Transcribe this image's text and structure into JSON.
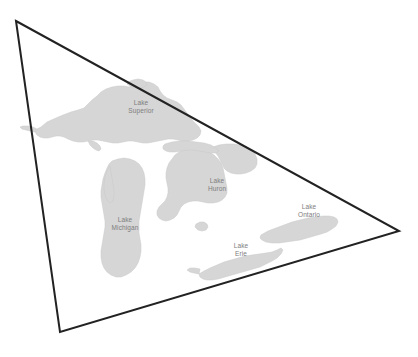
{
  "figure": {
    "name": "great-lakes-triangle-overlay",
    "background_color": "#ffffff",
    "width": 418,
    "height": 357
  },
  "overlay": {
    "shape": "triangle",
    "stroke_color": "#222222",
    "stroke_width": 2,
    "fill": "none",
    "vertices": [
      {
        "name": "top-left-vertex",
        "x": 16,
        "y": 21
      },
      {
        "name": "right-vertex",
        "x": 399,
        "y": 231
      },
      {
        "name": "bottom-left-vertex",
        "x": 60,
        "y": 332
      }
    ],
    "points_attr": "16,21 399,231 60,332"
  },
  "lakes": {
    "fill_color": "#d6d6d6",
    "label_color": "#7d7d7d",
    "items": [
      {
        "id": "lake-superior",
        "label": "Lake\nSuperior",
        "label_x": 141,
        "label_y": 106
      },
      {
        "id": "lake-huron",
        "label": "Lake\nHuron",
        "label_x": 217,
        "label_y": 184
      },
      {
        "id": "lake-michigan",
        "label": "Lake\nMichigan",
        "label_x": 125,
        "label_y": 223
      },
      {
        "id": "lake-ontario",
        "label": "Lake\nOntario",
        "label_x": 309,
        "label_y": 210
      },
      {
        "id": "lake-erie",
        "label": "Lake\nErie",
        "label_x": 241,
        "label_y": 249
      }
    ]
  },
  "paths": {
    "superior": "M41,127 L47,122 L56,118 L63,115 L71,112 L78,110 L84,108 L88,104 L92,100 L97,96 L101,92 L106,89 L112,87 L118,86 L124,86 L129,87 L133,85 L138,83 L143,82 L149,82 L154,84 L158,87 L160,91 L163,95 L167,98 L172,100 L177,102 L181,105 L184,109 L187,113 L190,117 L193,121 L196,124 L199,127 L201,131 L200,135 L197,138 L193,140 L188,141 L183,141 L178,140 L173,139 L168,139 L163,140 L158,141 L153,142 L148,143 L143,143 L138,142 L133,141 L128,141 L123,142 L118,143 L113,143 L108,142 L103,141 L98,140 L93,140 L88,141 L83,142 L78,142 L73,141 L68,139 L64,137 L60,136 L56,136 L52,137 L48,138 L44,138 L40,137 L37,135 L35,132 L37,129 Z",
    "superior_west_spit": "M35,132 L30,131 L26,130 L22,129 L20,127 L23,126 L28,126 L33,127 L37,129 Z",
    "superior_keweenaw": "M88,141 L90,145 L93,148 L96,150 L99,151 L101,149 L100,146 L97,143 L93,141 Z",
    "huron": "M179,152 L185,150 L191,149 L197,149 L203,150 L209,152 L214,155 L218,159 L221,163 L223,168 L224,173 L225,178 L226,183 L227,188 L227,193 L225,197 L222,200 L218,202 L213,203 L208,203 L203,202 L198,201 L193,201 L188,202 L184,204 L181,207 L179,211 L177,215 L174,218 L170,220 L166,221 L162,220 L159,218 L157,215 L157,211 L159,207 L162,204 L165,201 L167,197 L168,193 L168,188 L167,183 L166,178 L166,173 L167,168 L169,163 L172,159 L175,155 Z",
    "huron_georgian": "M213,147 L219,145 L226,144 L233,144 L240,145 L246,147 L251,150 L255,154 L257,159 L257,164 L255,168 L251,171 L246,173 L241,174 L236,174 L231,173 L227,171 L224,168 L222,164 L220,160 L218,156 L215,152 Z",
    "huron_north_channel": "M165,144 L172,142 L180,141 L188,141 L196,142 L204,143 L211,145 L216,148 L219,151 L216,153 L211,153 L205,152 L199,151 L193,150 L187,150 L181,151 L175,152 L170,152 L166,151 L163,149 L163,146 Z",
    "michigan": "M112,161 L118,159 L124,158 L130,159 L135,161 L139,164 L142,168 L144,173 L145,179 L145,185 L144,191 L143,197 L142,203 L141,209 L140,215 L139,221 L139,227 L139,233 L140,239 L141,245 L141,251 L140,257 L138,263 L135,268 L131,272 L126,275 L121,277 L116,277 L111,275 L107,272 L104,268 L102,263 L101,257 L101,251 L102,245 L103,239 L104,233 L105,227 L105,221 L104,215 L103,209 L102,203 L101,197 L101,191 L102,185 L103,179 L105,173 L107,168 L109,164 Z",
    "michigan_green_bay": "M110,166 L107,171 L105,177 L104,183 L104,189 L105,195 L107,200 L110,203 L113,201 L114,196 L114,190 L113,184 L112,178 L111,172 Z",
    "erie": "M204,271 L210,268 L217,265 L224,262 L231,260 L238,258 L245,256 L252,255 L259,254 L266,253 L272,252 L277,250 L281,248 L283,250 L281,254 L277,258 L272,261 L266,264 L260,267 L253,269 L246,271 L239,273 L232,275 L225,277 L218,279 L212,280 L207,280 L203,279 L200,277 L199,274 Z",
    "erie_west_tip": "M199,274 L194,273 L190,272 L187,270 L190,268 L195,268 L200,269 Z",
    "ontario": "M261,235 L268,231 L276,228 L284,225 L292,222 L300,220 L308,218 L316,217 L323,216 L329,216 L334,217 L337,219 L338,222 L336,226 L332,229 L327,232 L321,234 L314,236 L307,238 L300,240 L293,241 L286,242 L279,243 L272,243 L266,242 L262,240 L260,238 Z",
    "stclair": "M196,224 L200,222 L204,222 L207,224 L208,227 L206,230 L202,231 L198,230 L195,227 Z",
    "nipigon": "M128,82 L133,80 L138,79 L143,80 L146,82 L147,85 L144,87 L139,88 L134,88 L130,86 L127,84 Z"
  }
}
